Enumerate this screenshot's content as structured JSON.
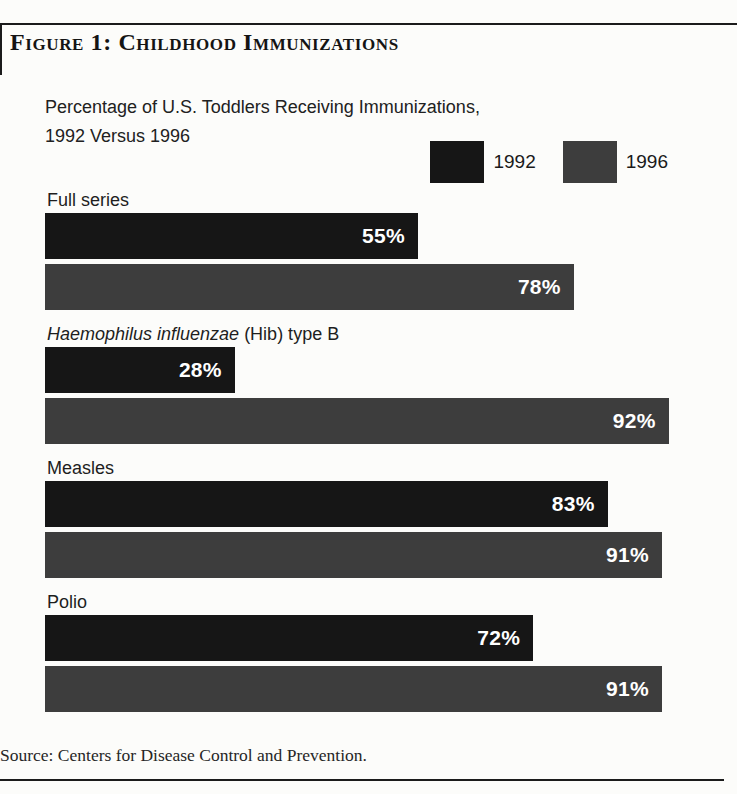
{
  "figure": {
    "title": "Figure 1: Childhood Immunizations",
    "source": "Source: Centers for Disease Control and Prevention."
  },
  "chart_data": {
    "type": "bar",
    "orientation": "horizontal",
    "title": "Percentage of U.S. Toddlers Receiving Immunizations, 1992 Versus 1996",
    "subtitle_lines": {
      "line1": "Percentage of U.S. Toddlers Receiving Immunizations,",
      "line2": "1992 Versus 1996"
    },
    "categories": [
      "Full series",
      "Haemophilus influenzae (Hib) type B",
      "Measles",
      "Polio"
    ],
    "categories_rich": [
      {
        "italic": "",
        "rest": "Full series"
      },
      {
        "italic": "Haemophilus influenzae",
        "rest": " (Hib) type B"
      },
      {
        "italic": "",
        "rest": "Measles"
      },
      {
        "italic": "",
        "rest": "Polio"
      }
    ],
    "series": [
      {
        "name": "1992",
        "color": "#161616",
        "values": [
          55,
          28,
          83,
          72
        ],
        "labels": [
          "55%",
          "28%",
          "83%",
          "72%"
        ]
      },
      {
        "name": "1996",
        "color": "#3d3d3d",
        "values": [
          78,
          92,
          91,
          91
        ],
        "labels": [
          "78%",
          "92%",
          "91%",
          "91%"
        ]
      }
    ],
    "value_axis": {
      "min": 0,
      "max": 100,
      "unit": "%"
    },
    "legend_position": "top-right",
    "grid": false
  }
}
